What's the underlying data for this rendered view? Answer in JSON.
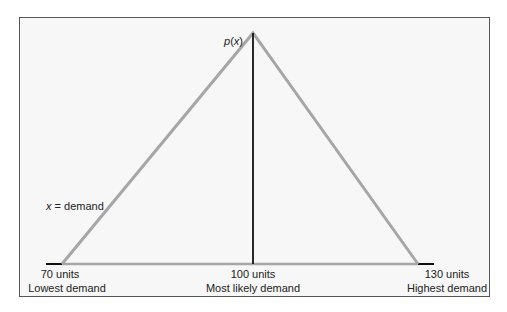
{
  "diagram": {
    "type": "triangular-distribution",
    "peak_label": "p(x)",
    "peak_label_parts": {
      "fn": "p",
      "open": "(",
      "var": "x",
      "close": ")"
    },
    "axis_label": {
      "var": "x",
      "rest": " = demand"
    },
    "points": [
      {
        "value": "70 units",
        "caption": "Lowest demand"
      },
      {
        "value": "100 units",
        "caption": "Most likely demand"
      },
      {
        "value": "130 units",
        "caption": "Highest demand"
      }
    ],
    "colors": {
      "triangle": "#a6a6a6",
      "median_line": "#111111",
      "baseline": "#a6a6a6",
      "frame": "#555555",
      "background": "#f7f7f7"
    }
  }
}
